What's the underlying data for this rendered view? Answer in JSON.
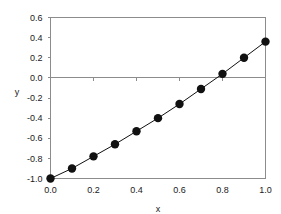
{
  "chart_data": {
    "type": "scatter",
    "title": "",
    "xlabel": "x",
    "ylabel": "y",
    "xlim": [
      0.0,
      1.0
    ],
    "ylim": [
      -1.0,
      0.6
    ],
    "grid": false,
    "legend": null,
    "x_ticks": [
      "0.0",
      "0.2",
      "0.4",
      "0.6",
      "0.8",
      "1.0"
    ],
    "x_tick_values": [
      0.0,
      0.2,
      0.4,
      0.6,
      0.8,
      1.0
    ],
    "y_ticks": [
      "0.6",
      "0.4",
      "0.2",
      "0.0",
      "-0.2",
      "-0.4",
      "-0.6",
      "-0.8",
      "-1.0"
    ],
    "y_tick_values": [
      0.6,
      0.4,
      0.2,
      0.0,
      -0.2,
      -0.4,
      -0.6,
      -0.8,
      -1.0
    ],
    "marker": "filled-circle",
    "marker_color": "#111111",
    "line_color": "#111111",
    "axis_color": "#8c8c8c",
    "zero_reference_line": 0.0,
    "x": [
      0.0,
      0.1,
      0.2,
      0.3,
      0.4,
      0.5,
      0.6,
      0.7,
      0.8,
      0.9,
      1.0
    ],
    "values": [
      -1.0,
      -0.9,
      -0.78,
      -0.66,
      -0.53,
      -0.4,
      -0.26,
      -0.11,
      0.04,
      0.2,
      0.36
    ],
    "series": [
      {
        "name": "series-1",
        "x": [
          0.0,
          0.1,
          0.2,
          0.3,
          0.4,
          0.5,
          0.6,
          0.7,
          0.8,
          0.9,
          1.0
        ],
        "values": [
          -1.0,
          -0.9,
          -0.78,
          -0.66,
          -0.53,
          -0.4,
          -0.26,
          -0.11,
          0.04,
          0.2,
          0.36
        ]
      }
    ]
  }
}
